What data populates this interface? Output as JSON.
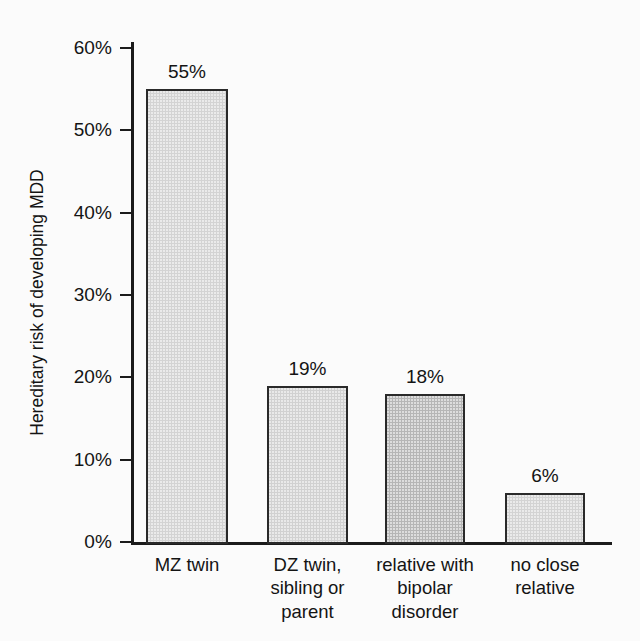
{
  "chart_data": {
    "type": "bar",
    "title": "",
    "xlabel": "",
    "ylabel": "Hereditary risk of developing MDD",
    "ylim": [
      0,
      60
    ],
    "ytick_labels": [
      "60%",
      "50%",
      "40%",
      "30%",
      "20%",
      "10%",
      "0%"
    ],
    "ytick_values": [
      60,
      50,
      40,
      30,
      20,
      10,
      0
    ],
    "grid": false,
    "legend": "none",
    "categories": [
      "MZ twin",
      "DZ twin, sibling or parent",
      "relative with bipolar disorder",
      "no close relative"
    ],
    "values": [
      55,
      19,
      18,
      6
    ],
    "value_labels": [
      "55%",
      "19%",
      "18%",
      "6%"
    ],
    "bars": [
      {
        "category_lines": [
          "MZ twin"
        ],
        "value": 55,
        "value_label": "55%",
        "fill": "#d3d3d3",
        "stroke": "#2a2a2a"
      },
      {
        "category_lines": [
          "DZ twin,",
          "sibling or",
          "parent"
        ],
        "value": 19,
        "value_label": "19%",
        "fill": "#d1d1d1",
        "stroke": "#2a2a2a"
      },
      {
        "category_lines": [
          "relative with",
          "bipolar",
          "disorder"
        ],
        "value": 18,
        "value_label": "18%",
        "fill": "#b6b6b6",
        "stroke": "#2a2a2a"
      },
      {
        "category_lines": [
          "no close",
          "relative"
        ],
        "value": 6,
        "value_label": "6%",
        "fill": "#d3d3d3",
        "stroke": "#2a2a2a"
      }
    ],
    "axis_color": "#1b1b1b",
    "background": "#fbfbfb"
  }
}
